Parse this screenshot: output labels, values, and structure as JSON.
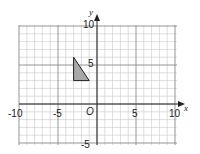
{
  "diagram": {
    "type": "coordinate-grid",
    "x_axis": {
      "label": "x",
      "min": -10,
      "max": 10,
      "ticks": [
        -10,
        -5,
        5,
        10
      ]
    },
    "y_axis": {
      "label": "y",
      "min": -5,
      "max": 10,
      "ticks": [
        10,
        5,
        -5
      ]
    },
    "origin_label": "O",
    "grid": {
      "minor_step": 1,
      "major_step": 5
    },
    "shape": {
      "name": "triangle",
      "vertices": [
        [
          -3,
          6
        ],
        [
          -3,
          3
        ],
        [
          -1,
          3
        ]
      ],
      "fill": "#a8a8a8",
      "stroke": "#222222"
    },
    "tick_labels": {
      "xm10": "-10",
      "xm5": "-5",
      "x5": "5",
      "x10": "10",
      "y10": "10",
      "y5": "5",
      "ym5": "-5"
    }
  }
}
